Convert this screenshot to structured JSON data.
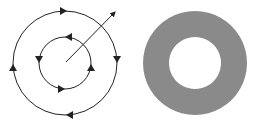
{
  "figure": {
    "left_panel": {
      "description": "Two concentric circles with directional arrows and a radial arrow",
      "center": [
        65,
        63
      ],
      "outer_circle": {
        "radius": 52,
        "direction": "clockwise"
      },
      "inner_circle": {
        "radius": 26,
        "direction": "counterclockwise"
      },
      "radial_arrow": {
        "from": [
          66,
          62
        ],
        "to": [
          116,
          11
        ]
      },
      "stroke_color": "#222222"
    },
    "right_panel": {
      "description": "Shaded annulus (ring)",
      "center": [
        65,
        63
      ],
      "outer_radius": 52,
      "inner_radius": 26,
      "fill_color": "#8a8a8a"
    }
  }
}
